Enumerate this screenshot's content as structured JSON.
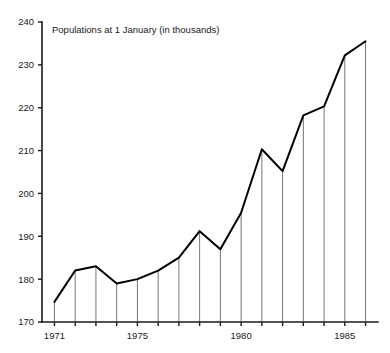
{
  "chart_data": {
    "type": "line",
    "title": "Populations at 1 January (in thousands)",
    "xlabel": "",
    "ylabel": "",
    "grid": false,
    "legend": false,
    "legend_position": "none",
    "line_color": "#000000",
    "drop_line_color": "#3a3a3a",
    "axis_color": "#1a1a1a",
    "background_color": "#ffffff",
    "xlim": [
      1970.4,
      1986.6
    ],
    "ylim": [
      170,
      240
    ],
    "y_ticks": [
      170,
      180,
      190,
      200,
      210,
      220,
      230,
      240
    ],
    "y_tick_labels": [
      "170",
      "180",
      "190",
      "200",
      "210",
      "220",
      "230",
      "240"
    ],
    "x_ticks": [
      1971,
      1972,
      1973,
      1974,
      1975,
      1976,
      1977,
      1978,
      1979,
      1980,
      1981,
      1982,
      1983,
      1984,
      1985,
      1986
    ],
    "x_tick_labels_shown": [
      "1971",
      "1975",
      "1980",
      "1985"
    ],
    "x_labeled_ticks": [
      1971,
      1975,
      1980,
      1985
    ],
    "categories": [
      1971,
      1972,
      1973,
      1974,
      1975,
      1976,
      1977,
      1978,
      1979,
      1980,
      1981,
      1982,
      1983,
      1984,
      1985,
      1986
    ],
    "x": [
      1971,
      1972,
      1973,
      1974,
      1975,
      1976,
      1977,
      1978,
      1979,
      1980,
      1981,
      1982,
      1983,
      1984,
      1985,
      1986
    ],
    "values": [
      174.7,
      182.0,
      183.0,
      179.0,
      180.0,
      182.0,
      185.0,
      191.2,
      187.0,
      195.5,
      210.3,
      205.2,
      218.2,
      220.3,
      232.2,
      235.5
    ],
    "series": [
      {
        "name": "Population",
        "values": [
          174.7,
          182.0,
          183.0,
          179.0,
          180.0,
          182.0,
          185.0,
          191.2,
          187.0,
          195.5,
          210.3,
          205.2,
          218.2,
          220.3,
          232.2,
          235.5
        ]
      }
    ],
    "annotations": []
  }
}
